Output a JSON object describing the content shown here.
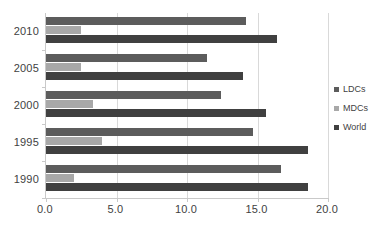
{
  "chart_data": {
    "type": "bar",
    "orientation": "horizontal",
    "title": "",
    "subtitle": "",
    "xlabel": "",
    "ylabel": "",
    "categories": [
      "2010",
      "2005",
      "2000",
      "1995",
      "1990"
    ],
    "series": [
      {
        "name": "LDCs",
        "color": "#5c5c5c",
        "values": [
          14.2,
          11.4,
          12.4,
          14.7,
          16.7
        ]
      },
      {
        "name": "MDCs",
        "color": "#a8a8a8",
        "values": [
          2.5,
          2.5,
          3.3,
          4.0,
          2.0
        ]
      },
      {
        "name": "World",
        "color": "#404040",
        "values": [
          16.4,
          14.0,
          15.6,
          18.6,
          18.6
        ]
      }
    ],
    "xlim": [
      0.0,
      20.0
    ],
    "xticks": [
      0.0,
      5.0,
      10.0,
      15.0,
      20.0
    ],
    "xtick_labels": [
      "0.0",
      "5.0",
      "10.0",
      "15.0",
      "20.0"
    ],
    "grid": true,
    "grid_axis": "x",
    "legend_position": "right"
  },
  "axis": {
    "y_labels": [
      "2010",
      "2005",
      "2000",
      "1995",
      "1990"
    ],
    "x_labels": [
      "0.0",
      "5.0",
      "10.0",
      "15.0",
      "20.0"
    ]
  },
  "legend": {
    "items": [
      {
        "label": "LDCs",
        "color": "#5c5c5c"
      },
      {
        "label": "MDCs",
        "color": "#a8a8a8"
      },
      {
        "label": "World",
        "color": "#404040"
      }
    ]
  },
  "caption": {
    "text": ""
  }
}
